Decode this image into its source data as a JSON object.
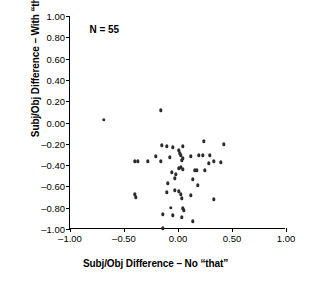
{
  "chart_data": {
    "type": "scatter",
    "title": "",
    "xlabel": "Subj/Obj Difference – No “that”",
    "ylabel": "Subj/Obj Difference – With “that”",
    "xlim": [
      -1.0,
      1.0
    ],
    "ylim": [
      -1.0,
      1.0
    ],
    "xticks": [
      "-1.00",
      "-0.50",
      "0.00",
      "0.50",
      "1.00"
    ],
    "xtick_values": [
      -1.0,
      -0.5,
      0.0,
      0.5,
      1.0
    ],
    "yticks": [
      "1.00",
      "0.80",
      "0.60",
      "0.40",
      "0.20",
      "0.00",
      "-0.20",
      "-0.40",
      "-0.60",
      "-0.80",
      "-1.00"
    ],
    "ytick_values": [
      1.0,
      0.8,
      0.6,
      0.4,
      0.2,
      0.0,
      -0.2,
      -0.4,
      -0.6,
      -0.8,
      -1.0
    ],
    "grid": false,
    "legend": null,
    "annotations": [
      {
        "text": "N = 55",
        "x": -0.82,
        "y": 0.87
      }
    ],
    "n": 55,
    "marker_color": "#2b2b2b",
    "points": [
      {
        "x": -0.685,
        "y": 0.025
      },
      {
        "x": -0.157,
        "y": 0.113
      },
      {
        "x": -0.148,
        "y": -0.213
      },
      {
        "x": 0.046,
        "y": -0.222
      },
      {
        "x": 0.241,
        "y": -0.175
      },
      {
        "x": 0.426,
        "y": -0.203
      },
      {
        "x": -0.102,
        "y": -0.222
      },
      {
        "x": -0.046,
        "y": -0.232
      },
      {
        "x": 0.009,
        "y": -0.26
      },
      {
        "x": 0.019,
        "y": -0.288
      },
      {
        "x": 0.028,
        "y": -0.307
      },
      {
        "x": 0.231,
        "y": -0.307
      },
      {
        "x": 0.296,
        "y": -0.307
      },
      {
        "x": -0.204,
        "y": -0.316
      },
      {
        "x": -0.074,
        "y": -0.325
      },
      {
        "x": 0.12,
        "y": -0.316
      },
      {
        "x": 0.194,
        "y": -0.307
      },
      {
        "x": 0.046,
        "y": -0.335
      },
      {
        "x": 0.037,
        "y": -0.354
      },
      {
        "x": -0.398,
        "y": -0.363
      },
      {
        "x": -0.37,
        "y": -0.363
      },
      {
        "x": -0.278,
        "y": -0.363
      },
      {
        "x": -0.157,
        "y": -0.363
      },
      {
        "x": 0.333,
        "y": -0.363
      },
      {
        "x": 0.398,
        "y": -0.373
      },
      {
        "x": 0.287,
        "y": -0.382
      },
      {
        "x": 0.009,
        "y": -0.429
      },
      {
        "x": 0.028,
        "y": -0.42
      },
      {
        "x": 0.046,
        "y": -0.439
      },
      {
        "x": 0.157,
        "y": -0.448
      },
      {
        "x": 0.176,
        "y": -0.448
      },
      {
        "x": 0.25,
        "y": -0.448
      },
      {
        "x": -0.056,
        "y": -0.467
      },
      {
        "x": -0.019,
        "y": -0.486
      },
      {
        "x": -0.028,
        "y": -0.524
      },
      {
        "x": 0.139,
        "y": -0.533
      },
      {
        "x": -0.093,
        "y": -0.571
      },
      {
        "x": 0.185,
        "y": -0.59
      },
      {
        "x": -0.102,
        "y": -0.656
      },
      {
        "x": -0.398,
        "y": -0.675
      },
      {
        "x": -0.389,
        "y": -0.704
      },
      {
        "x": -0.028,
        "y": -0.637
      },
      {
        "x": 0.009,
        "y": -0.647
      },
      {
        "x": 0.028,
        "y": -0.675
      },
      {
        "x": 0.12,
        "y": -0.684
      },
      {
        "x": 0.333,
        "y": -0.722
      },
      {
        "x": 0.037,
        "y": -0.713
      },
      {
        "x": -0.065,
        "y": -0.8
      },
      {
        "x": 0.046,
        "y": -0.807
      },
      {
        "x": 0.056,
        "y": -0.826
      },
      {
        "x": -0.139,
        "y": -0.863
      },
      {
        "x": -0.046,
        "y": -0.873
      },
      {
        "x": 0.037,
        "y": -0.892
      },
      {
        "x": 0.139,
        "y": -0.929
      },
      {
        "x": -0.143,
        "y": -0.995
      }
    ]
  }
}
